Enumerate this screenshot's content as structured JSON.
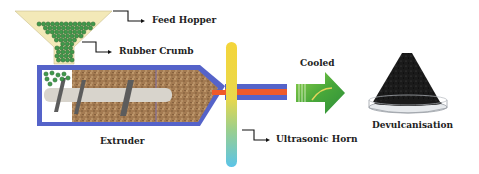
{
  "diagram": {
    "labels": {
      "feed_hopper": "Feed Hopper",
      "rubber_crumb": "Rubber Crumb",
      "extruder": "Extruder",
      "ultrasonic_horn": "Ultrasonic Horn",
      "cooled": "Cooled",
      "devulcanisation": "Devulcanisation"
    },
    "colors": {
      "hopper_fill": "#f3e9b8",
      "crumb_green": "#3e9a4a",
      "barrel_blue": "#5563c9",
      "screw_shaft": "#d8d4cc",
      "screw_flight": "#5c5c5c",
      "melt_brown": "#a0794f",
      "core_red": "#ef5a2a",
      "horn_top": "#f2d23a",
      "horn_bottom": "#5bc7e6",
      "arrow_green": "#4fae3c",
      "product_black": "#1c1c1c"
    }
  }
}
